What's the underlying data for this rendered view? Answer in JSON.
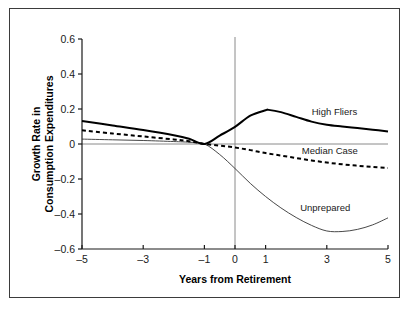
{
  "figure": {
    "background_color": "#ffffff",
    "frame_color": "#3b3b3b"
  },
  "chart_data": {
    "type": "line",
    "title": "",
    "xlabel": "Years from Retirement",
    "ylabel": "Growth Rate in Consumption Expenditures",
    "ylabel_line1": "Growth Rate in",
    "ylabel_line2": "Consumption Expenditures",
    "xlim": [
      -5,
      5
    ],
    "ylim": [
      -0.6,
      0.6
    ],
    "xticks": [
      -5,
      -3,
      -1,
      0,
      1,
      3,
      5
    ],
    "xtick_labels": [
      "–5",
      "–3",
      "–1",
      "0",
      "1",
      "3",
      "5"
    ],
    "yticks": [
      -0.6,
      -0.4,
      -0.2,
      0,
      0.2,
      0.4,
      0.6
    ],
    "ytick_labels": [
      "–0.6",
      "–0.4",
      "–0.2",
      "0",
      "0.2",
      "0.4",
      "0.6"
    ],
    "grid": false,
    "legend_position": "inline-annotations",
    "reference_lines": [
      {
        "name": "retirement-year-vline",
        "orientation": "vertical",
        "value": 0,
        "color": "#8a8a8a"
      },
      {
        "name": "zero-growth-hline",
        "orientation": "horizontal",
        "value": 0,
        "color": "#8a8a8a"
      }
    ],
    "series": [
      {
        "name": "High Fliers",
        "label": "High Fliers",
        "style": "solid-bold",
        "color": "#000000",
        "line_width": 2.0,
        "x": [
          -5,
          -4,
          -3,
          -2,
          -1.5,
          -1,
          -0.5,
          0,
          0.5,
          1,
          1.1,
          1.5,
          2,
          2.5,
          3,
          3.5,
          4,
          4.5,
          5
        ],
        "values": [
          0.132,
          0.106,
          0.08,
          0.05,
          0.03,
          0.0,
          0.048,
          0.098,
          0.162,
          0.193,
          0.195,
          0.182,
          0.155,
          0.128,
          0.11,
          0.1,
          0.091,
          0.082,
          0.072
        ]
      },
      {
        "name": "Median Case",
        "label": "Median Case",
        "style": "dashed",
        "color": "#000000",
        "line_width": 2.0,
        "dash_pattern": "4,3",
        "x": [
          -5,
          -4,
          -3,
          -2,
          -1.5,
          -1,
          -0.5,
          0,
          0.5,
          1,
          1.5,
          2,
          2.5,
          3,
          3.5,
          4,
          4.5,
          5
        ],
        "values": [
          0.078,
          0.06,
          0.043,
          0.026,
          0.016,
          0.0,
          -0.009,
          -0.02,
          -0.035,
          -0.052,
          -0.066,
          -0.08,
          -0.094,
          -0.106,
          -0.116,
          -0.124,
          -0.131,
          -0.137
        ]
      },
      {
        "name": "Unprepared",
        "label": "Unprepared",
        "style": "solid-thin",
        "color": "#333333",
        "line_width": 0.9,
        "x": [
          -5,
          -4,
          -3,
          -2,
          -1.5,
          -1,
          -0.5,
          0,
          0.5,
          1,
          1.5,
          2,
          2.5,
          3,
          3.5,
          4,
          4.5,
          5
        ],
        "values": [
          0.028,
          0.024,
          0.02,
          0.014,
          0.01,
          0.0,
          -0.06,
          -0.14,
          -0.225,
          -0.3,
          -0.365,
          -0.42,
          -0.465,
          -0.497,
          -0.5,
          -0.488,
          -0.462,
          -0.422
        ]
      }
    ],
    "annotations": [
      {
        "name": "high-fliers-label",
        "text": "High Fliers",
        "x": 3.25,
        "y": 0.165
      },
      {
        "name": "median-case-label",
        "text": "Median Case",
        "x": 3.1,
        "y": -0.058
      },
      {
        "name": "unprepared-label",
        "text": "Unprepared",
        "x": 2.95,
        "y": -0.385
      }
    ]
  }
}
